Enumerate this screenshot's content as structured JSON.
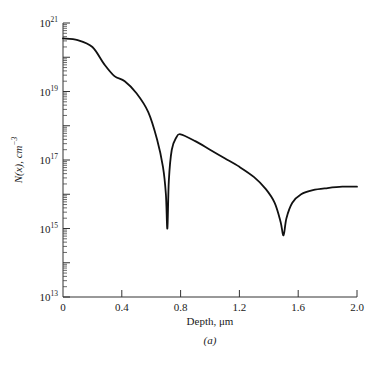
{
  "chart_data": {
    "type": "line",
    "title": "",
    "subtitle": "(a)",
    "xlabel": "Depth, μm",
    "ylabel": "N(x), cm⁻³",
    "xlim": [
      0,
      2.0
    ],
    "ylim": [
      10000000000000.0,
      1e+21
    ],
    "yscale": "log",
    "grid": false,
    "legend": null,
    "x_ticks": [
      0,
      0.4,
      0.8,
      1.2,
      1.6,
      2.0
    ],
    "x_tick_labels": [
      "0",
      "0.4",
      "0.8",
      "1.2",
      "1.6",
      "2.0"
    ],
    "y_ticks_exponent": [
      21,
      19,
      17,
      15,
      13
    ],
    "y_tick_labels": [
      "10^21",
      "10^19",
      "10^17",
      "10^15",
      "10^13"
    ],
    "series": [
      {
        "name": "N(x)",
        "x": [
          0.0,
          0.1,
          0.2,
          0.28,
          0.35,
          0.42,
          0.5,
          0.58,
          0.64,
          0.68,
          0.7,
          0.71,
          0.72,
          0.74,
          0.77,
          0.8,
          0.9,
          1.0,
          1.1,
          1.2,
          1.3,
          1.38,
          1.44,
          1.48,
          1.5,
          1.52,
          1.56,
          1.62,
          1.7,
          1.8,
          1.9,
          2.0
        ],
        "log10_y": [
          20.55,
          20.5,
          20.3,
          19.8,
          19.45,
          19.3,
          18.95,
          18.4,
          17.6,
          16.8,
          16.0,
          15.0,
          16.4,
          17.3,
          17.65,
          17.75,
          17.55,
          17.3,
          17.05,
          16.8,
          16.5,
          16.15,
          15.75,
          15.2,
          14.8,
          15.3,
          15.75,
          16.0,
          16.12,
          16.18,
          16.22,
          16.22
        ]
      }
    ],
    "annotations": [
      "(a)"
    ]
  },
  "labels": {
    "y_base": "10",
    "x_axis_title": "Depth, μm",
    "y_axis_title": "N(x), cm",
    "y_axis_title_exp": "−3",
    "panel_label": "(a)"
  }
}
